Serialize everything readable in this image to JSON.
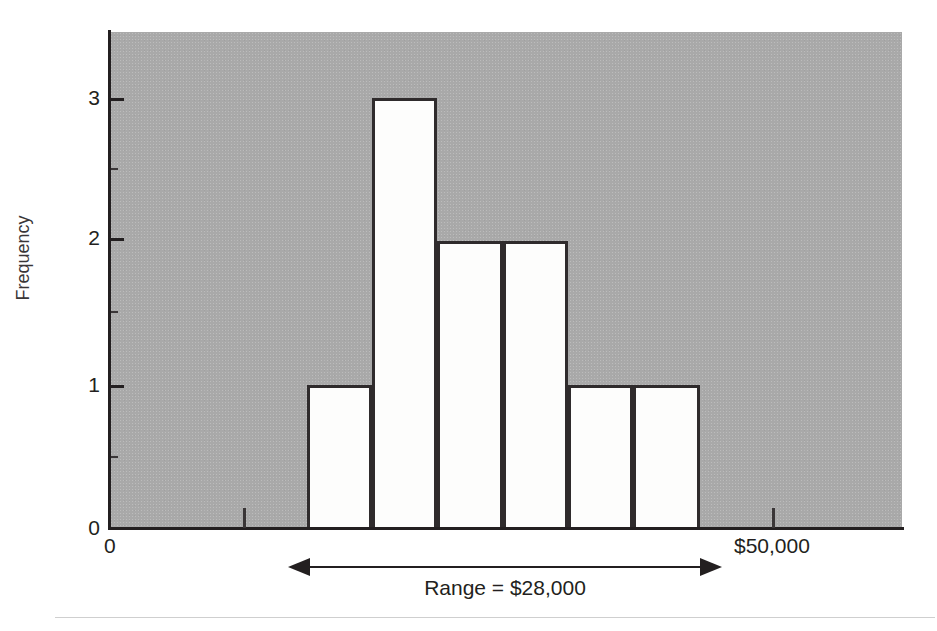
{
  "chart_data": {
    "type": "bar",
    "title": "",
    "subtitle": "",
    "xlabel": "",
    "ylabel": "Frequency",
    "grid": false,
    "legend": null,
    "ylim": [
      0,
      3.5
    ],
    "y_ticks": [
      "0",
      "1",
      "2",
      "3"
    ],
    "y_tick_values": [
      0,
      1,
      2,
      3
    ],
    "y_minor_ticks": [
      0.5,
      1.5,
      2.5
    ],
    "x_ticks": [
      "0",
      "$50,000"
    ],
    "x_origin_label": "0",
    "x_right_label": "$50,000",
    "categories": [
      "bin-1",
      "bin-2",
      "bin-3",
      "bin-4",
      "bin-5",
      "bin-6"
    ],
    "values": [
      1,
      3,
      2,
      2,
      1,
      1
    ],
    "bars": [
      {
        "name": "bin-1",
        "value": 1,
        "x0": 307,
        "x1": 372
      },
      {
        "name": "bin-2",
        "value": 3,
        "x0": 372,
        "x1": 437
      },
      {
        "name": "bin-3",
        "value": 2,
        "x0": 437,
        "x1": 503
      },
      {
        "name": "bin-4",
        "value": 2,
        "x0": 503,
        "x1": 568
      },
      {
        "name": "bin-5",
        "value": 1,
        "x0": 568,
        "x1": 633
      },
      {
        "name": "bin-6",
        "value": 1,
        "x0": 633,
        "x1": 700
      }
    ],
    "annotations": [
      {
        "name": "range-annotation",
        "label": "Range = $28,000",
        "value": 28000,
        "style": "double-headed-arrow",
        "x_start": 310,
        "x_end": 700
      }
    ],
    "colors": {
      "plot_background": "#a9a9a9",
      "bar_fill": "#fdfdfc",
      "bar_outline": "#2f2b2c",
      "axis": "#231f20",
      "text": "#231f20",
      "page_background": "#ffffff",
      "footer_rule": "#cfcfcf"
    }
  },
  "axis": {
    "y_title": "Frequency",
    "ticks_y": [
      {
        "label": "3",
        "value": 3,
        "top": 98
      },
      {
        "label": "2",
        "value": 2,
        "top": 238
      },
      {
        "label": "1",
        "value": 1,
        "top": 385
      },
      {
        "label": "0",
        "value": 0,
        "top": 528
      }
    ],
    "minor_ticks_y": [
      168,
      311,
      456
    ],
    "ticks_x": [
      {
        "label": "0",
        "left": 110,
        "has_mark": false
      },
      {
        "label": "",
        "left": 243,
        "has_mark": true
      },
      {
        "label": "$50,000",
        "left": 772,
        "has_mark": true
      }
    ]
  },
  "range_annotation": {
    "label": "Range = $28,000"
  }
}
